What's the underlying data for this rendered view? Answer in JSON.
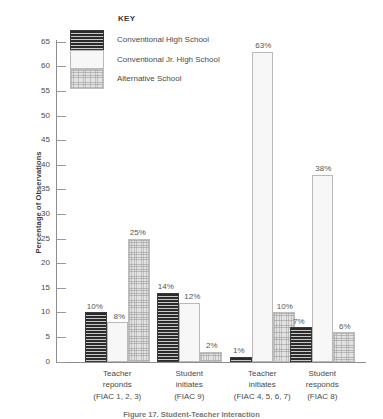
{
  "chart_data": {
    "type": "bar",
    "title": "",
    "xlabel": "",
    "ylabel": "Percentage of Observations",
    "ylim": [
      0,
      65
    ],
    "ytick_step": 5,
    "yticks": [
      0,
      5,
      10,
      15,
      20,
      25,
      30,
      35,
      40,
      45,
      50,
      55,
      60,
      65
    ],
    "grid": false,
    "legend_title": "KEY",
    "legend_position": "top-center",
    "categories": [
      "Teacher reponds",
      "Student initiates",
      "Teacher initiates",
      "Student responds"
    ],
    "category_sublabels": [
      "(FIAC 1, 2, 3)",
      "(FIAC 9)",
      "(FIAC 4, 5, 6, 7)",
      "(FIAC 8)"
    ],
    "series": [
      {
        "name": "Conventional High School",
        "pattern": "dark-horizontal-stripes",
        "color": "#3b3b3b",
        "values": [
          10,
          14,
          1,
          7
        ],
        "labels": [
          "10%",
          "14%",
          "1%",
          "7%"
        ]
      },
      {
        "name": "Conventional Jr. High School",
        "pattern": "white-solid",
        "color": "#f7f7f7",
        "values": [
          8,
          12,
          63,
          38
        ],
        "labels": [
          "8%",
          "12%",
          "63%",
          "38%"
        ]
      },
      {
        "name": "Alternative School",
        "pattern": "light-gray-stipple",
        "color": "#e2e2e2",
        "values": [
          25,
          2,
          10,
          6
        ],
        "labels": [
          "25%",
          "2%",
          "10%",
          "6%"
        ]
      }
    ]
  },
  "axis": {
    "y_label": "Percentage of Observations",
    "y_tick_labels": [
      "65",
      "60",
      "55",
      "50",
      "45",
      "40",
      "35",
      "30",
      "25",
      "20",
      "15",
      "10",
      "5",
      "0"
    ]
  },
  "legend": {
    "title": "KEY",
    "items": [
      {
        "label": "Conventional High School"
      },
      {
        "label": "Conventional Jr. High School"
      },
      {
        "label": "Alternative School"
      }
    ]
  },
  "caption": {
    "text": "Figure 17.  Student-Teacher Interaction"
  }
}
